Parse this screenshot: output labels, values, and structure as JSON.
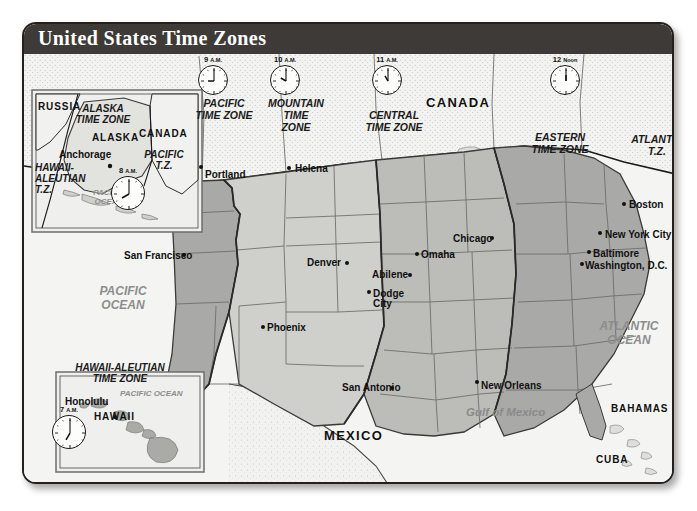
{
  "map": {
    "title": "United States Time Zones",
    "colors": {
      "banner": "#3d3a38",
      "pacific_zone": "#a9a9a7",
      "mountain_zone": "#cfcfcb",
      "central_zone": "#bcbcb8",
      "eastern_zone": "#a9a9a7",
      "canada_mexico": "#f1f1ef",
      "ocean": "#f4f4f2",
      "border": "#23201e"
    },
    "clocks": [
      {
        "name": "pacific-clock",
        "time": "9",
        "suffix": "A.M.",
        "hour": 9,
        "x": 196,
        "y": 54
      },
      {
        "name": "mountain-clock",
        "time": "10",
        "suffix": "A.M.",
        "hour": 10,
        "x": 268,
        "y": 54
      },
      {
        "name": "central-clock",
        "time": "11",
        "suffix": "A.M.",
        "hour": 11,
        "x": 370,
        "y": 54
      },
      {
        "name": "eastern-clock",
        "time": "12",
        "suffix": "Noon",
        "hour": 12,
        "x": 548,
        "y": 54
      },
      {
        "name": "alaska-clock",
        "time": "8",
        "suffix": "A.M.",
        "hour": 8,
        "x": 109,
        "y": 165
      },
      {
        "name": "hawaii-clock",
        "time": "7",
        "suffix": "A.M.",
        "hour": 7,
        "x": 50,
        "y": 404
      }
    ],
    "zone_labels": [
      {
        "name": "zone-label-pacific",
        "text": "PACIFIC\nTIME ZONE",
        "x": 184,
        "y": 96,
        "w": 76
      },
      {
        "name": "zone-label-mountain",
        "text": "MOUNTAIN\nTIME\nZONE",
        "x": 258,
        "y": 96,
        "w": 72
      },
      {
        "name": "zone-label-central",
        "text": "CENTRAL\nTIME ZONE",
        "x": 346,
        "y": 108,
        "w": 92
      },
      {
        "name": "zone-label-eastern",
        "text": "EASTERN\nTIME ZONE",
        "x": 516,
        "y": 130,
        "w": 84
      },
      {
        "name": "zone-label-atlantic",
        "text": "ATLANTIC\nT.Z.",
        "x": 628,
        "y": 132,
        "w": 54
      }
    ],
    "countries": [
      {
        "name": "country-label-canada",
        "text": "CANADA",
        "x": 424,
        "y": 94,
        "size": "lg"
      },
      {
        "name": "country-label-mexico",
        "text": "MEXICO",
        "x": 322,
        "y": 427,
        "size": "lg"
      },
      {
        "name": "country-label-bahamas",
        "text": "BAHAMAS",
        "x": 609,
        "y": 402,
        "size": "sm"
      },
      {
        "name": "country-label-cuba",
        "text": "CUBA",
        "x": 594,
        "y": 453,
        "size": "sm"
      }
    ],
    "oceans": [
      {
        "name": "ocean-label-pacific",
        "text": "PACIFIC\nOCEAN",
        "x": 81,
        "y": 283,
        "w": 80,
        "cls": "ocean"
      },
      {
        "name": "ocean-label-atlantic",
        "text": "ATLANTIC\nOCEAN",
        "x": 586,
        "y": 318,
        "w": 82,
        "cls": "ocean"
      },
      {
        "name": "ocean-label-gulf",
        "text": "Gulf of Mexico",
        "x": 464,
        "y": 405,
        "w": 0,
        "cls": "gulf"
      }
    ],
    "cities": [
      {
        "name": "city-portland",
        "label": "Portland",
        "lx": 203,
        "ly": 168,
        "dx": 197,
        "dy": 163,
        "dotside": "left"
      },
      {
        "name": "city-helena",
        "label": "Helena",
        "lx": 293,
        "ly": 162,
        "dx": 285,
        "dy": 164,
        "dotside": "left"
      },
      {
        "name": "city-san-francisco",
        "label": "San Francisco",
        "lx": 122,
        "ly": 249,
        "dx": 180,
        "dy": 251,
        "dotside": "right"
      },
      {
        "name": "city-denver",
        "label": "Denver",
        "lx": 305,
        "ly": 256,
        "dx": 343,
        "dy": 259,
        "dotside": "right"
      },
      {
        "name": "city-abilene",
        "label": "Abilene",
        "lx": 370,
        "ly": 268,
        "dx": 406,
        "dy": 271,
        "dotside": "right"
      },
      {
        "name": "city-dodge-city",
        "label": "Dodge City",
        "lx": 371,
        "ly": 287,
        "dx": 365,
        "dy": 288,
        "dotside": "left",
        "two": true
      },
      {
        "name": "city-omaha",
        "label": "Omaha",
        "lx": 419,
        "ly": 248,
        "dx": 413,
        "dy": 250,
        "dotside": "left"
      },
      {
        "name": "city-chicago",
        "label": "Chicago",
        "lx": 451,
        "ly": 232,
        "dx": 488,
        "dy": 234,
        "dotside": "right"
      },
      {
        "name": "city-phoenix",
        "label": "Phoenix",
        "lx": 265,
        "ly": 321,
        "dx": 259,
        "dy": 323,
        "dotside": "left"
      },
      {
        "name": "city-san-antonio",
        "label": "San Antonio",
        "lx": 340,
        "ly": 381,
        "dx": 388,
        "dy": 384,
        "dotside": "right"
      },
      {
        "name": "city-new-orleans",
        "label": "New Orleans",
        "lx": 479,
        "ly": 379,
        "dx": 473,
        "dy": 378,
        "dotside": "left"
      },
      {
        "name": "city-boston",
        "label": "Boston",
        "lx": 627,
        "ly": 198,
        "dx": 620,
        "dy": 200,
        "dotside": "left"
      },
      {
        "name": "city-new-york-city",
        "label": "New York City",
        "lx": 603,
        "ly": 228,
        "dx": 596,
        "dy": 229,
        "dotside": "left"
      },
      {
        "name": "city-baltimore",
        "label": "Baltimore",
        "lx": 591,
        "ly": 247,
        "dx": 585,
        "dy": 248,
        "dotside": "left"
      },
      {
        "name": "city-washington-dc",
        "label": "Washington, D.C.",
        "lx": 583,
        "ly": 259,
        "dx": 578,
        "dy": 260,
        "dotside": "left"
      }
    ],
    "alaska_inset": {
      "name": "alaska-inset",
      "labels": [
        {
          "name": "alaska-inset-russia",
          "text": "RUSSIA",
          "x": 36,
          "y": 100,
          "cls": "country sm"
        },
        {
          "name": "alaska-inset-canada",
          "text": "CANADA",
          "x": 137,
          "y": 127,
          "cls": "country sm"
        },
        {
          "name": "alaska-inset-title",
          "text": "ALASKA\nTIME ZONE",
          "x": 65,
          "y": 101,
          "cls": "inset-title",
          "w": 72
        },
        {
          "name": "alaska-inset-alaska",
          "text": "ALASKA",
          "x": 90,
          "y": 131,
          "cls": "country sm"
        },
        {
          "name": "alaska-inset-anchorage",
          "text": "Anchorage",
          "x": 57,
          "y": 148,
          "cls": "city"
        },
        {
          "name": "alaska-inset-hawaii-tz",
          "text": "HAWAII-\nALEUTIAN\nT.Z.",
          "x": 33,
          "y": 160,
          "cls": "inset-title",
          "w": 46,
          "align": "left"
        },
        {
          "name": "alaska-inset-pacific-tz",
          "text": "PACIFIC\nT.Z.",
          "x": 142,
          "y": 147,
          "cls": "inset-title",
          "w": 40
        },
        {
          "name": "alaska-inset-ocean",
          "text": "PACIFIC\nOCEAN",
          "x": 82,
          "y": 186,
          "cls": "ocean sm",
          "w": 50
        }
      ]
    },
    "hawaii_inset": {
      "name": "hawaii-inset",
      "labels": [
        {
          "name": "hawaii-inset-title",
          "text": "HAWAII-ALEUTIAN\nTIME ZONE",
          "x": 58,
          "y": 360,
          "cls": "inset-title",
          "w": 120
        },
        {
          "name": "hawaii-inset-ocean",
          "text": "PACIFIC  OCEAN",
          "x": 118,
          "y": 387,
          "cls": "ocean sm"
        },
        {
          "name": "hawaii-inset-honolulu",
          "text": "Honolulu",
          "x": 63,
          "y": 395,
          "cls": "city"
        },
        {
          "name": "hawaii-inset-hawaii",
          "text": "HAWAII",
          "x": 92,
          "y": 410,
          "cls": "country sm"
        }
      ]
    }
  }
}
